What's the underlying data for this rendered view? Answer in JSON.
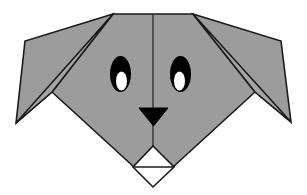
{
  "canvas": {
    "width": 307,
    "height": 195,
    "background_color": "#ffffff",
    "title": "Origami Dog Face"
  },
  "palette": {
    "paper_gray": "#9c9c9c",
    "paper_gray_light": "#a5a5a5",
    "outline_black": "#1a1a1a",
    "crease_line": "#2b2b2b",
    "eye_black": "#000000",
    "pupil_white": "#ffffff",
    "nose_black": "#000000",
    "muzzle_white": "#ffffff",
    "background_white": "#ffffff"
  },
  "figure": {
    "name": "origami-dog-face",
    "stroke_width": 1.6,
    "parts": [
      {
        "id": "left-ear",
        "label": "Left Ear",
        "points": "113,14 25,41 16,123 52,92",
        "fill": "paper_gray"
      },
      {
        "id": "right-ear",
        "label": "Right Ear",
        "points": "193,14 281,41 291,122 255,92",
        "fill": "paper_gray"
      },
      {
        "id": "head",
        "label": "Head",
        "points": "113,14 193,14 255,92 173,167 134,167 52,92",
        "fill": "paper_gray"
      },
      {
        "id": "left-cheek-fold",
        "label": "Left Cheek Fold",
        "points": "113,14 52,92 16,123",
        "fill": "paper_gray_light"
      },
      {
        "id": "right-cheek-fold",
        "label": "Right Cheek Fold",
        "points": "193,14 255,92 291,122",
        "fill": "paper_gray_light"
      },
      {
        "id": "muzzle",
        "label": "Muzzle Diamond",
        "points": "153,146 174,167 153,187 133,167",
        "fill": "muzzle_white"
      }
    ],
    "creases": [
      {
        "id": "center-crease",
        "label": "Center Vertical Crease",
        "from": "153,14",
        "to": "153,146"
      },
      {
        "id": "muzzle-crease",
        "label": "Muzzle Horizontal Crease",
        "from": "134,167",
        "to": "173,167"
      }
    ],
    "eyes": [
      {
        "id": "left-eye",
        "label": "Left Eye",
        "cx": 120.5,
        "cy": 74,
        "rx": 10.5,
        "ry": 18,
        "pupil": {
          "cx": 121.5,
          "cy": 81,
          "rx": 5.5,
          "ry": 9.5
        }
      },
      {
        "id": "right-eye",
        "label": "Right Eye",
        "cx": 180.5,
        "cy": 74,
        "rx": 10.5,
        "ry": 18,
        "pupil": {
          "cx": 179.5,
          "cy": 81,
          "rx": 5.5,
          "ry": 9.5
        }
      }
    ],
    "nose": {
      "id": "nose",
      "label": "Nose",
      "points": "139,108 168,108 153.5,126"
    }
  }
}
